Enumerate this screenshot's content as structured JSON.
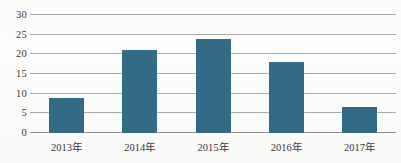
{
  "chart_data": {
    "type": "bar",
    "title": "",
    "xlabel": "",
    "ylabel": "",
    "categories": [
      "2013年",
      "2014年",
      "2015年",
      "2016年",
      "2017年"
    ],
    "values": [
      9,
      21,
      24,
      18,
      6.7
    ],
    "ylim": [
      0,
      30
    ],
    "ytick_labels": [
      "30",
      "25",
      "20",
      "15",
      "10",
      "5",
      "0"
    ],
    "ytick_values": [
      30,
      25,
      20,
      15,
      10,
      5,
      0
    ],
    "ytick_step": 5,
    "grid": true,
    "grid_orientation": "horizontal",
    "legend": false,
    "legend_position": "none",
    "series": [
      {
        "name": "",
        "values": [
          9,
          21,
          24,
          18,
          6.7
        ]
      }
    ],
    "colors": {
      "bar": "#336b87",
      "gridline": "#a9a9a9",
      "baseline": "#8f8f8f",
      "text": "#3a3a3a",
      "background": "#fdfdfc"
    }
  }
}
